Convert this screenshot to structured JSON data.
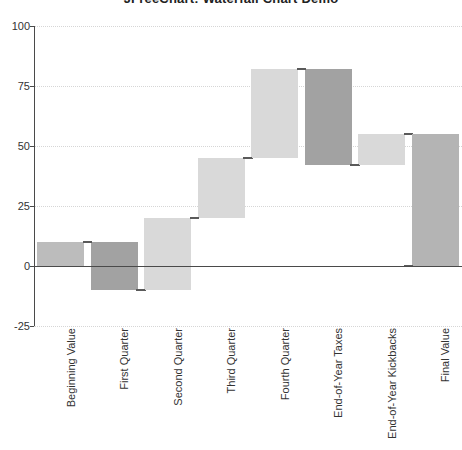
{
  "chart_data": {
    "type": "bar",
    "subtype": "waterfall",
    "title": "JFreeChart: Waterfall Chart Demo",
    "xlabel": "",
    "ylabel": "",
    "ylim": [
      -25,
      100
    ],
    "yticks": [
      100,
      75,
      50,
      25,
      0,
      -25
    ],
    "ytick_labels": [
      "100",
      "75",
      "50",
      "25",
      "0",
      "-25"
    ],
    "grid": true,
    "grid_axis": "y",
    "legend": false,
    "categories": [
      "Beginning Value",
      "First Quarter",
      "Second Quarter",
      "Third Quarter",
      "Fourth Quarter",
      "End-of-Year Taxes",
      "End-of-Year Kickbacks",
      "Final Value"
    ],
    "deltas": [
      10,
      -20,
      30,
      25,
      37,
      -40,
      13,
      55
    ],
    "bars": [
      {
        "label": "Beginning Value",
        "start": 0,
        "end": 10,
        "value": 10,
        "kind": "first",
        "color": "#bcbcbc"
      },
      {
        "label": "First Quarter",
        "start": 10,
        "end": -10,
        "value": -20,
        "kind": "decrease",
        "color": "#a2a2a2"
      },
      {
        "label": "Second Quarter",
        "start": -10,
        "end": 20,
        "value": 30,
        "kind": "increase",
        "color": "#d9d9d9"
      },
      {
        "label": "Third Quarter",
        "start": 20,
        "end": 45,
        "value": 25,
        "kind": "increase",
        "color": "#d9d9d9"
      },
      {
        "label": "Fourth Quarter",
        "start": 45,
        "end": 82,
        "value": 37,
        "kind": "increase",
        "color": "#d9d9d9"
      },
      {
        "label": "End-of-Year Taxes",
        "start": 82,
        "end": 42,
        "value": -40,
        "kind": "decrease",
        "color": "#a2a2a2"
      },
      {
        "label": "End-of-Year Kickbacks",
        "start": 42,
        "end": 55,
        "value": 13,
        "kind": "increase",
        "color": "#d9d9d9"
      },
      {
        "label": "Final Value",
        "start": 0,
        "end": 55,
        "value": 55,
        "kind": "total",
        "color": "#b4b4b4"
      }
    ],
    "colors": {
      "first_bar": "#bcbcbc",
      "increase": "#d9d9d9",
      "decrease": "#a2a2a2",
      "total": "#b4b4b4",
      "axis": "#4a4a4a",
      "gridline": "#d6d6d6",
      "background": "#ffffff",
      "text": "#333333"
    }
  }
}
